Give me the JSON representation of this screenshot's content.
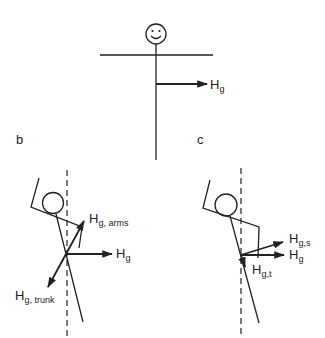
{
  "figure": {
    "panels": [
      {
        "id": "a",
        "label": "",
        "figure": "upright stick figure with smiley face, arms horizontal",
        "vectors": [
          {
            "name": "H_g",
            "label_main": "H",
            "label_sub": "g"
          }
        ]
      },
      {
        "id": "b",
        "label": "b",
        "figure": "tilted stick figure with arms raised, dashed vertical reference",
        "vectors": [
          {
            "name": "H_g_arms",
            "label_main": "H",
            "label_sub": "g, arms"
          },
          {
            "name": "H_g",
            "label_main": "H",
            "label_sub": "g"
          },
          {
            "name": "H_g_trunk",
            "label_main": "H",
            "label_sub": "g, trunk"
          }
        ]
      },
      {
        "id": "c",
        "label": "c",
        "figure": "tilted stick figure with arms raised, dashed vertical reference",
        "vectors": [
          {
            "name": "H_g_s",
            "label_main": "H",
            "label_sub": "g,s"
          },
          {
            "name": "H_g",
            "label_main": "H",
            "label_sub": "g"
          },
          {
            "name": "H_g_t",
            "label_main": "H",
            "label_sub": "g,t"
          }
        ]
      }
    ]
  },
  "colors": {
    "ink": "#222222",
    "background": "#ffffff"
  }
}
